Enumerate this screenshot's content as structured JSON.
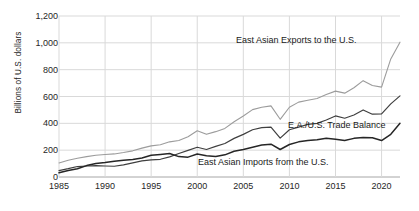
{
  "chart_data": {
    "type": "line",
    "title": "",
    "xlabel": "",
    "ylabel": "Billions of U.S. dollars",
    "xlim": [
      1985,
      2022
    ],
    "ylim": [
      0,
      1200
    ],
    "grid": true,
    "legend_position": "inline-annotations",
    "x_ticks": [
      "1985",
      "1990",
      "1995",
      "2000",
      "2005",
      "2010",
      "2015",
      "2020"
    ],
    "y_ticks": [
      "0",
      "200",
      "400",
      "600",
      "800",
      "1,000",
      "1,200"
    ],
    "x": [
      1985,
      1986,
      1987,
      1988,
      1989,
      1990,
      1991,
      1992,
      1993,
      1994,
      1995,
      1996,
      1997,
      1998,
      1999,
      2000,
      2001,
      2002,
      2003,
      2004,
      2005,
      2006,
      2007,
      2008,
      2009,
      2010,
      2011,
      2012,
      2013,
      2014,
      2015,
      2016,
      2017,
      2018,
      2019,
      2020,
      2021,
      2022
    ],
    "series": [
      {
        "name": "East Asian Exports to the U.S.",
        "color": "#9c9c9c",
        "values": [
          105,
          125,
          140,
          152,
          162,
          168,
          172,
          182,
          195,
          215,
          232,
          240,
          262,
          272,
          300,
          345,
          318,
          338,
          362,
          412,
          455,
          502,
          520,
          530,
          430,
          520,
          558,
          572,
          585,
          615,
          640,
          625,
          665,
          718,
          682,
          670,
          880,
          1005
        ]
      },
      {
        "name": "E.A./U.S. Trade Balance",
        "color": "#3f3f3f",
        "values": [
          48,
          62,
          78,
          82,
          85,
          82,
          80,
          90,
          105,
          120,
          128,
          132,
          150,
          175,
          198,
          222,
          205,
          228,
          250,
          288,
          318,
          352,
          368,
          372,
          290,
          352,
          372,
          392,
          400,
          425,
          455,
          438,
          462,
          500,
          468,
          470,
          545,
          605
        ]
      },
      {
        "name": "East Asian Imports from the U.S.",
        "color": "#262626",
        "values": [
          32,
          48,
          62,
          85,
          100,
          108,
          118,
          125,
          130,
          142,
          162,
          168,
          175,
          152,
          148,
          172,
          158,
          152,
          165,
          192,
          205,
          222,
          238,
          245,
          205,
          242,
          262,
          272,
          278,
          288,
          282,
          272,
          288,
          295,
          292,
          272,
          318,
          400
        ]
      }
    ],
    "annotations": [
      {
        "text": "East Asian Exports to the U.S.",
        "x_px": 236,
        "y_px": 35
      },
      {
        "text": "E.A./U.S. Trade Balance",
        "x_px": 288,
        "y_px": 120
      },
      {
        "text": "East Asian Imports from the U.S.",
        "x_px": 198,
        "y_px": 157
      }
    ]
  }
}
